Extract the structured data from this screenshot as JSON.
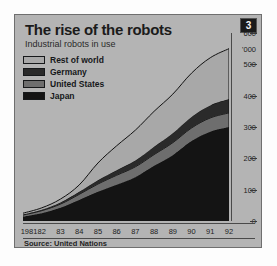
{
  "panel": {
    "title": "The rise of the robots",
    "subtitle": "Industrial robots in use",
    "badge": "3",
    "source": "Source: United Nations"
  },
  "colors": {
    "panel_bg": "#b4b4b4",
    "rest_of_world": "#a8a8a8",
    "germany": "#2a2a2a",
    "united_states": "#6e6e6e",
    "japan": "#141414",
    "outline": "#121212",
    "badge_bg": "#1a1a1a"
  },
  "legend": {
    "items": [
      {
        "label": "Rest of world",
        "color": "#a8a8a8"
      },
      {
        "label": "Germany",
        "color": "#2a2a2a"
      },
      {
        "label": "United States",
        "color": "#6e6e6e"
      },
      {
        "label": "Japan",
        "color": "#141414"
      }
    ]
  },
  "chart_data": {
    "type": "area",
    "stacked": true,
    "title": "The rise of the robots",
    "subtitle": "Industrial robots in use",
    "xlabel": "",
    "ylabel": "'000",
    "unit_label": "'000",
    "grid": false,
    "legend_position": "top-left",
    "y_axis_side": "right",
    "ylim": [
      0,
      600
    ],
    "yticks": [
      0,
      100,
      200,
      300,
      400,
      500,
      600
    ],
    "categories": [
      "1981",
      "82",
      "83",
      "84",
      "85",
      "86",
      "87",
      "88",
      "89",
      "90",
      "91",
      "92"
    ],
    "x_tick_labels": [
      "1981",
      "82",
      "83",
      "84",
      "85",
      "86",
      "87",
      "88",
      "89",
      "90",
      "91",
      "92"
    ],
    "stack_order_bottom_to_top": [
      "Japan",
      "United States",
      "Germany",
      "Rest of world"
    ],
    "series": [
      {
        "name": "Japan",
        "color": "#141414",
        "values": [
          14,
          25,
          42,
          67,
          93,
          116,
          140,
          176,
          210,
          255,
          285,
          300
        ]
      },
      {
        "name": "United States",
        "color": "#6e6e6e",
        "values": [
          5,
          8,
          12,
          18,
          25,
          30,
          33,
          36,
          40,
          42,
          44,
          45
        ]
      },
      {
        "name": "Germany",
        "color": "#2a2a2a",
        "values": [
          2,
          3,
          5,
          8,
          12,
          16,
          20,
          25,
          30,
          35,
          40,
          44
        ]
      },
      {
        "name": "Rest of world",
        "color": "#a8a8a8",
        "values": [
          4,
          6,
          11,
          22,
          55,
          78,
          97,
          113,
          125,
          140,
          152,
          161
        ]
      }
    ],
    "totals": [
      25,
      42,
      70,
      115,
      185,
      240,
      290,
      350,
      405,
      472,
      521,
      550
    ]
  },
  "yaxis": {
    "ticks": [
      "600",
      "500",
      "400",
      "300",
      "200",
      "100",
      "0"
    ],
    "unit": "'000"
  }
}
